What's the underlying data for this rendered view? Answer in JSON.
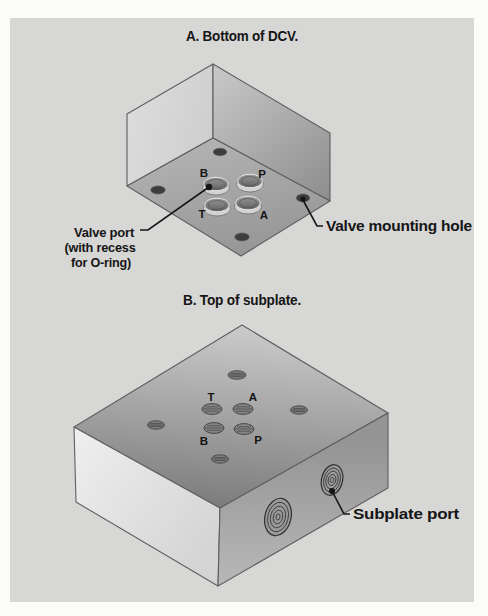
{
  "colors": {
    "page_bg": "#fbfbfa",
    "panel_bg": "#d7d7d6",
    "ink": "#151515"
  },
  "figure_a": {
    "title": "A. Bottom of DCV.",
    "port_top_left": "B",
    "port_top_right": "P",
    "port_bottom_left": "T",
    "port_bottom_right": "A",
    "valve_port_label_line1": "Valve port",
    "valve_port_label_line2": "(with recess",
    "valve_port_label_line3": "for O-ring)",
    "mounting_hole_label": "Valve mounting hole"
  },
  "figure_b": {
    "title": "B. Top of subplate.",
    "port_top_left": "T",
    "port_top_right": "A",
    "port_bottom_left": "B",
    "port_bottom_right": "P",
    "subplate_port_label": "Subplate port"
  }
}
